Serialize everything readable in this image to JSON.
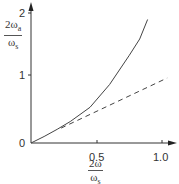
{
  "chart_data": {
    "type": "line",
    "title": "",
    "xlabel": "2ω/ωs",
    "ylabel": "2ωa/ωs",
    "xlim": [
      0,
      1.1
    ],
    "ylim": [
      0,
      2.1
    ],
    "grid": false,
    "legend": null,
    "x_ticks": [
      "0.5",
      "1.0"
    ],
    "y_ticks": [
      "0",
      "1",
      "2"
    ],
    "series": [
      {
        "name": "frequency warping curve",
        "style": "solid",
        "x": [
          0.0,
          0.1,
          0.2,
          0.3,
          0.45,
          0.6,
          0.75,
          0.83,
          0.89
        ],
        "y": [
          0.0,
          0.1,
          0.21,
          0.33,
          0.55,
          0.9,
          1.35,
          1.6,
          1.9
        ]
      },
      {
        "name": "linear reference",
        "style": "dashed",
        "x": [
          0.23,
          1.04
        ],
        "y": [
          0.23,
          1.0
        ]
      }
    ]
  },
  "labels": {
    "y_tick_0": "0",
    "y_tick_1": "1",
    "y_tick_2": "2",
    "x_tick_05": "0.5",
    "x_tick_10": "1.0",
    "y_label_num": "2ω",
    "y_label_num_sub": "a",
    "y_label_den": "ω",
    "y_label_den_sub": "s",
    "x_label_num": "2ω",
    "x_label_den": "ω",
    "x_label_den_sub": "s"
  }
}
